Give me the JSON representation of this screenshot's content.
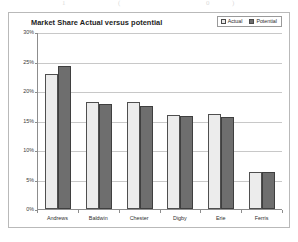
{
  "page": {
    "top_fragments": [
      "1",
      "(",
      "0",
      ")"
    ]
  },
  "chart": {
    "title": "Market Share Actual versus potential",
    "legend": {
      "items": [
        {
          "label": "Actual",
          "color": "#ececec",
          "key": "actual"
        },
        {
          "label": "Potential",
          "color": "#6e6e6e",
          "key": "potential"
        }
      ]
    }
  },
  "chart_data": {
    "type": "bar",
    "title": "Market Share Actual versus potential",
    "xlabel": "",
    "ylabel": "",
    "ylim": [
      0,
      30
    ],
    "ytick_labels": [
      "30%",
      "25%",
      "20%",
      "15%",
      "10%",
      "5%",
      "0%"
    ],
    "ytick_values": [
      30,
      25,
      20,
      15,
      10,
      5,
      0
    ],
    "grid": true,
    "legend_position": "top-right",
    "categories": [
      "Andrews",
      "Baldwin",
      "Chester",
      "Digby",
      "Erie",
      "Ferris"
    ],
    "series": [
      {
        "name": "Actual",
        "color": "#ececec",
        "values": [
          22.8,
          18.2,
          18.2,
          16.0,
          16.1,
          6.2
        ]
      },
      {
        "name": "Potential",
        "color": "#6e6e6e",
        "values": [
          24.2,
          17.8,
          17.5,
          15.8,
          15.6,
          6.3
        ]
      }
    ]
  }
}
